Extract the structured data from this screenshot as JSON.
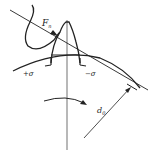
{
  "diagram": {
    "labels": {
      "force": "F",
      "force_sub": "n",
      "stress_left": "+σ",
      "stress_right": "−σ",
      "diameter": "d",
      "diameter_sub": "0"
    },
    "colors": {
      "stroke": "#222222",
      "background": "#ffffff"
    }
  }
}
